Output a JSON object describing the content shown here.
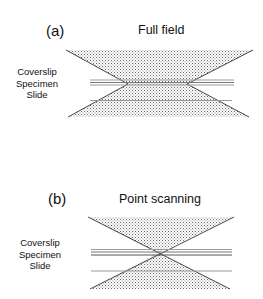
{
  "panels": [
    {
      "letter": "(a)",
      "title": "Full field",
      "layers": [
        "Coverslip",
        "Specimen",
        "Slide"
      ],
      "beam_shape": "truncated double cone with wide waist"
    },
    {
      "letter": "(b)",
      "title": "Point scanning",
      "layers": [
        "Coverslip",
        "Specimen",
        "Slide"
      ],
      "beam_shape": "double cone converging to a point"
    }
  ],
  "colors": {
    "hatch": "#555555",
    "edge": "#333333",
    "layer_lines": "#9a9a9a"
  }
}
